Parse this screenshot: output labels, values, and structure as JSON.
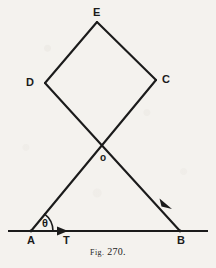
{
  "figure": {
    "caption_prefix": "Fig",
    "caption_abbrev_dot": ".",
    "caption_number": "270.",
    "caption_full": "Fig. 270.",
    "background_color": "#f4f2ee",
    "ink_color": "#1b1b1b"
  },
  "labels": {
    "E": "E",
    "D": "D",
    "C": "C",
    "O": "o",
    "A": "A",
    "T": "T",
    "B": "B",
    "theta": "θ"
  },
  "geometry": {
    "points": {
      "E": {
        "x": 97,
        "y": 22
      },
      "D": {
        "x": 45,
        "y": 83
      },
      "C": {
        "x": 156,
        "y": 80
      },
      "O": {
        "x": 103,
        "y": 148
      },
      "A": {
        "x": 31,
        "y": 231
      },
      "T": {
        "x": 66,
        "y": 231
      },
      "B": {
        "x": 180,
        "y": 231
      }
    },
    "baseline": {
      "x1": 8,
      "y1": 231,
      "x2": 208,
      "y2": 231
    },
    "segments": [
      {
        "name": "E-D",
        "from": "E",
        "to": "D"
      },
      {
        "name": "E-C",
        "from": "E",
        "to": "C"
      },
      {
        "name": "A-C",
        "from": "A",
        "to": "C"
      },
      {
        "name": "D-B",
        "from": "D",
        "to": "B"
      }
    ],
    "angle_arc": {
      "center": "A",
      "radius": 22,
      "label": "θ"
    },
    "arrow_markers": [
      {
        "name": "direction-arrow-T",
        "x": 63,
        "y": 231,
        "direction": "right"
      },
      {
        "name": "direction-arrow-DB",
        "x": 166,
        "y": 205,
        "direction": "down-right"
      }
    ]
  }
}
